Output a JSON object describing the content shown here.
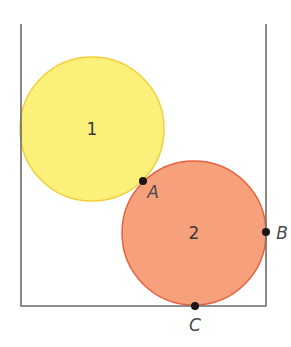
{
  "diagram": {
    "container": {
      "left_x": 21,
      "right_x": 266,
      "top_y": 24,
      "bottom_y": 306,
      "stroke": "#6b6b6b"
    },
    "circles": [
      {
        "label": "1",
        "cx": 92,
        "cy": 129,
        "r": 72,
        "fill": "#fbf07a",
        "stroke": "#f2cf3a"
      },
      {
        "label": "2",
        "cx": 194,
        "cy": 233,
        "r": 72,
        "fill": "#f7a07c",
        "stroke": "#e8603c"
      }
    ],
    "points": [
      {
        "label": "A",
        "x": 143,
        "y": 181,
        "label_x": 153,
        "label_y": 192
      },
      {
        "label": "B",
        "x": 266,
        "y": 232,
        "label_x": 282,
        "label_y": 233
      },
      {
        "label": "C",
        "x": 195,
        "y": 306,
        "label_x": 195,
        "label_y": 325
      }
    ],
    "point_color": "#1c1416"
  }
}
